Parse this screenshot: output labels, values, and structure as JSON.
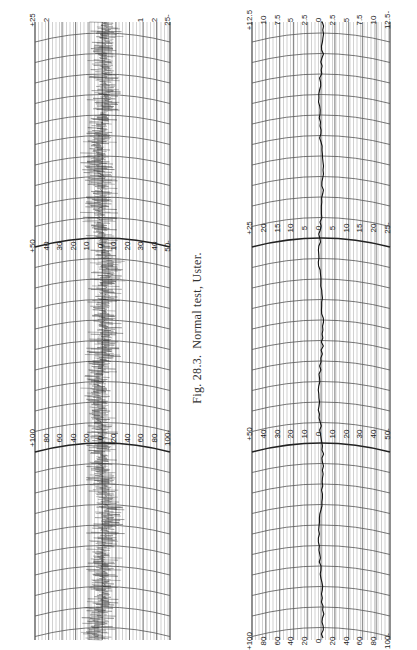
{
  "caption": {
    "fig": "Fig. 28.3.",
    "text": "Normal test, Uster."
  },
  "chart_data": [
    {
      "type": "line",
      "title": "Uster evenness diagram (left strip) — yarn irregularity trace",
      "orientation": "rotated 90°, trace runs top-to-bottom",
      "scale_sections": [
        {
          "range": "±25",
          "labels": [
            "+25",
            "20",
            "15",
            "10",
            "5",
            "0",
            "5",
            "10",
            "15",
            "20",
            "25-"
          ],
          "visible_labels": [
            "+25",
            "2",
            "2",
            "25-"
          ]
        },
        {
          "range": "±50",
          "labels": [
            "+50",
            "40",
            "30",
            "20",
            "10",
            "0",
            "10",
            "20",
            "30",
            "40",
            "50-"
          ]
        },
        {
          "range": "±100",
          "labels": [
            "+100",
            "80",
            "60",
            "40",
            "20",
            "0",
            "20",
            "40",
            "60",
            "80",
            "100-"
          ]
        }
      ],
      "trace": "dense noisy signal centred near 0, amplitude roughly ±10% of scale",
      "grid": true
    },
    {
      "type": "line",
      "title": "Uster evenness diagram (right strip) — mean deviation trace",
      "orientation": "rotated 90°, trace runs top-to-bottom",
      "scale_sections": [
        {
          "range": "±12.5",
          "labels": [
            "+12.5",
            "10",
            "7.5",
            "5",
            "2.5",
            "0",
            "2.5",
            "5",
            "7.5",
            "10",
            "12.5-"
          ]
        },
        {
          "range": "±25",
          "labels": [
            "+25",
            "20",
            "15",
            "10",
            "5",
            "0",
            "5",
            "10",
            "15",
            "20",
            "25-"
          ]
        },
        {
          "range": "±50",
          "labels": [
            "+50",
            "40",
            "30",
            "20",
            "10",
            "0",
            "10",
            "20",
            "30",
            "40",
            "50-"
          ]
        },
        {
          "range": "±100",
          "labels": [
            "+100",
            "80",
            "60",
            "40",
            "20",
            "0",
            "20",
            "40",
            "60",
            "80",
            "100-"
          ]
        }
      ],
      "trace": "thin smooth line near 0 with small wander",
      "grid": true
    }
  ],
  "left": {
    "sections": [
      {
        "y": 14,
        "labels": [
          "+25",
          "2",
          "",
          "",
          "",
          "",
          "",
          "",
          "1",
          "2",
          "25-"
        ]
      },
      {
        "y": 240,
        "labels": [
          "+50",
          "40",
          "30",
          "20",
          "10",
          "0",
          "10",
          "20",
          "30",
          "40",
          "50-"
        ]
      },
      {
        "y": 432,
        "labels": [
          "+100",
          "80",
          "60",
          "40",
          "20",
          "0",
          "20",
          "40",
          "60",
          "80",
          "100-"
        ]
      }
    ]
  },
  "right": {
    "sections": [
      {
        "y": 14,
        "labels": [
          "+12.5",
          "10",
          "7.5",
          "5",
          "2.5",
          "0",
          "2.5",
          "5",
          "7.5",
          "10",
          "12.5-"
        ]
      },
      {
        "y": 222,
        "labels": [
          "+25",
          "20",
          "15",
          "10",
          "5",
          "0",
          "5",
          "10",
          "15",
          "20",
          "25-"
        ]
      },
      {
        "y": 428,
        "labels": [
          "+50",
          "40",
          "30",
          "20",
          "10",
          "0",
          "10",
          "20",
          "30",
          "40",
          "50-"
        ]
      },
      {
        "y": 635,
        "labels": [
          "+100",
          "80",
          "60",
          "40",
          "20",
          "0",
          "20",
          "40",
          "60",
          "80",
          "100-"
        ]
      }
    ]
  }
}
